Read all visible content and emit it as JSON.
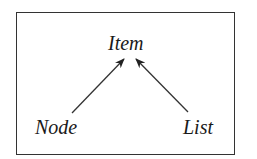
{
  "diagram": {
    "nodes": {
      "top": "Item",
      "left": "Node",
      "right": "List"
    },
    "edges": [
      {
        "from": "Node",
        "to": "Item"
      },
      {
        "from": "List",
        "to": "Item"
      }
    ]
  }
}
